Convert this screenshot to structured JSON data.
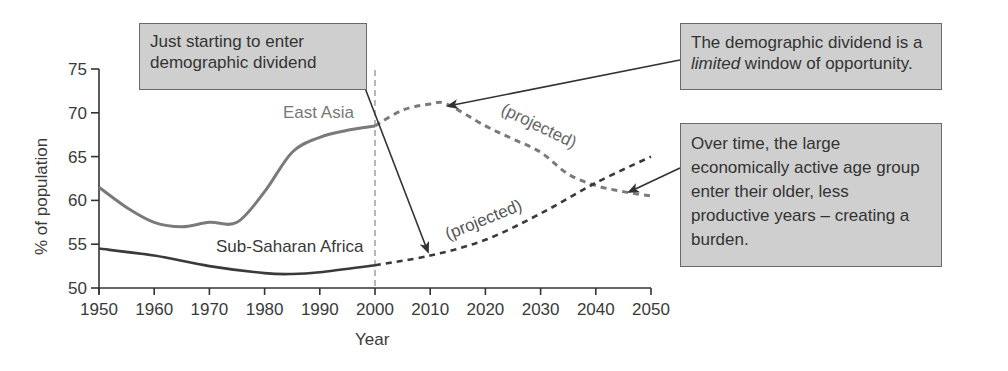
{
  "chart_data": {
    "type": "line",
    "title": "",
    "xlabel": "Year",
    "ylabel": "% of population",
    "xlim": [
      1950,
      2050
    ],
    "ylim": [
      50,
      75
    ],
    "x_ticks": [
      "1950",
      "1960",
      "1970",
      "1980",
      "1990",
      "2000",
      "2010",
      "2020",
      "2030",
      "2040",
      "2050"
    ],
    "y_ticks": [
      "50",
      "55",
      "60",
      "65",
      "70",
      "75"
    ],
    "grid": false,
    "reference_line": {
      "x": 2000,
      "style": "dashed"
    },
    "series": [
      {
        "name": "East Asia",
        "color": "#777777",
        "actual": {
          "x": [
            1950,
            1955,
            1960,
            1965,
            1970,
            1975,
            1980,
            1985,
            1990,
            1995,
            2000
          ],
          "y": [
            61.5,
            59.2,
            57.5,
            57.0,
            57.5,
            57.5,
            61.0,
            65.5,
            67.2,
            68.0,
            68.5
          ]
        },
        "projected": {
          "x": [
            2000,
            2005,
            2010,
            2013,
            2020,
            2025,
            2030,
            2035,
            2040,
            2045,
            2050
          ],
          "y": [
            68.5,
            70.3,
            71.0,
            71.0,
            68.5,
            67.0,
            65.5,
            63.0,
            61.7,
            61.0,
            60.5
          ],
          "label": "(projected)"
        }
      },
      {
        "name": "Sub-Saharan Africa",
        "color": "#333333",
        "actual": {
          "x": [
            1950,
            1960,
            1970,
            1980,
            1985,
            1990,
            2000
          ],
          "y": [
            54.5,
            53.7,
            52.5,
            51.7,
            51.6,
            51.8,
            52.6
          ]
        },
        "projected": {
          "x": [
            2000,
            2010,
            2020,
            2030,
            2040,
            2050
          ],
          "y": [
            52.6,
            53.7,
            55.5,
            58.5,
            62.0,
            65.0
          ],
          "label": "(projected)"
        }
      }
    ],
    "annotations": [
      {
        "text": "Just starting to enter demographic dividend"
      },
      {
        "text": "The demographic dividend is a limited window of opportunity."
      },
      {
        "text": "Over time, the large economically active age group enter their older, less productive years – creating a burden."
      }
    ]
  },
  "labels": {
    "east_asia": "East Asia",
    "ssa": "Sub-Saharan Africa",
    "projected_ea": "(projected)",
    "projected_ssa": "(projected)",
    "xlabel": "Year",
    "ylabel": "% of population"
  },
  "callouts": {
    "c1_line1": "Just starting to enter",
    "c1_line2": "demographic dividend",
    "c2_line1": "The demographic dividend is a",
    "c2_italic": "limited",
    "c2_line2_rest": " window of opportunity.",
    "c3_line1": "Over time, the large",
    "c3_line2": "economically active age group",
    "c3_line3": "enter their older, less",
    "c3_line4": "productive years – creating a",
    "c3_line5": "burden."
  }
}
